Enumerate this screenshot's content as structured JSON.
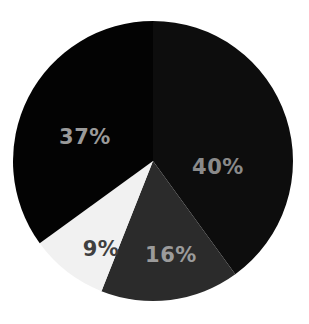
{
  "chart_data": {
    "type": "pie",
    "title": "",
    "subtitle": "",
    "xlabel": "",
    "ylabel": "",
    "grid": false,
    "legend": "none",
    "start_angle_deg": 0,
    "direction": "clockwise",
    "categories": [
      "Segment 1",
      "Segment 2",
      "Segment 3",
      "Segment 4"
    ],
    "values": [
      40,
      16,
      9,
      37
    ],
    "value_unit": "%",
    "labels": [
      "40%",
      "16%",
      "9%",
      "37%"
    ],
    "slice_colors": [
      "#0d0d0d",
      "#2b2b2b",
      "#f1f1f1",
      "#030303"
    ],
    "label_colors": [
      "#8a8a8a",
      "#9b9b9b",
      "#3f3f3f",
      "#9a9a9a"
    ],
    "slices": [
      {
        "name": "Segment 1",
        "label": "40%",
        "value": 40,
        "color": "#0d0d0d",
        "label_color": "#8a8a8a",
        "start_deg": 0,
        "end_deg": 144,
        "label_x": 218,
        "label_y": 168
      },
      {
        "name": "Segment 2",
        "label": "16%",
        "value": 16,
        "color": "#2b2b2b",
        "label_color": "#9b9b9b",
        "start_deg": 144,
        "end_deg": 201.6,
        "label_x": 171,
        "label_y": 256
      },
      {
        "name": "Segment 3",
        "label": "9%",
        "value": 9,
        "color": "#f1f1f1",
        "label_color": "#3f3f3f",
        "start_deg": 201.6,
        "end_deg": 234,
        "label_x": 101,
        "label_y": 250
      },
      {
        "name": "Segment 4",
        "label": "37%",
        "value": 37,
        "color": "#030303",
        "label_color": "#9a9a9a",
        "start_deg": 234,
        "end_deg": 360,
        "label_x": 85,
        "label_y": 138
      }
    ],
    "geometry": {
      "center_x": 153,
      "center_y": 161,
      "radius": 140
    },
    "background_color": "#ffffff"
  }
}
